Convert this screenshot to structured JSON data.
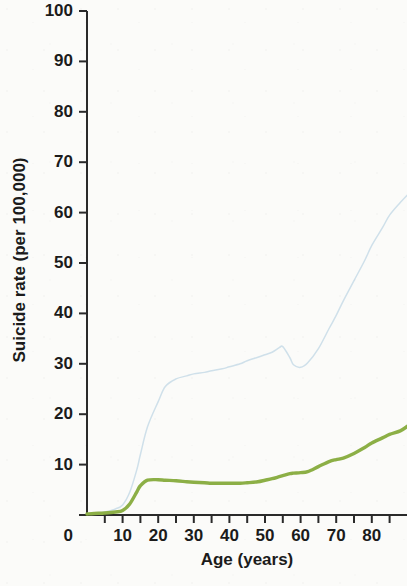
{
  "chart_data": {
    "type": "line",
    "title": "",
    "xlabel": "Age (years)",
    "ylabel": "Suicide rate (per 100,000)",
    "xlim": [
      0,
      90
    ],
    "ylim": [
      0,
      100
    ],
    "grid": false,
    "legend": "none",
    "x_tick_labels": [
      "10",
      "20",
      "30",
      "40",
      "50",
      "60",
      "70",
      "80"
    ],
    "x_tick_values": [
      10,
      20,
      30,
      40,
      50,
      60,
      70,
      80
    ],
    "x_minor_tick_values": [
      5,
      15,
      25,
      35,
      45,
      55,
      65,
      75,
      85
    ],
    "y_tick_labels": [
      "0",
      "10",
      "20",
      "30",
      "40",
      "50",
      "60",
      "70",
      "80",
      "90",
      "100"
    ],
    "y_tick_values": [
      0,
      10,
      20,
      30,
      40,
      50,
      60,
      70,
      80,
      90,
      100
    ],
    "x": [
      0,
      2,
      5,
      8,
      10,
      12,
      14,
      15,
      17,
      20,
      22,
      25,
      28,
      30,
      33,
      35,
      38,
      40,
      43,
      45,
      48,
      50,
      52,
      54,
      55,
      57,
      58,
      60,
      62,
      65,
      68,
      70,
      72,
      75,
      78,
      80,
      83,
      85,
      88,
      90
    ],
    "series": [
      {
        "name": "higher-rate-line",
        "color": "#cfe0ea",
        "style": "solid-thin",
        "values": [
          0.3,
          0.4,
          0.6,
          1.2,
          2.0,
          4.5,
          9.0,
          12.0,
          17.5,
          22.5,
          25.5,
          27.0,
          27.6,
          28.0,
          28.3,
          28.6,
          29.0,
          29.4,
          30.0,
          30.6,
          31.3,
          31.8,
          32.3,
          33.2,
          33.4,
          31.2,
          29.8,
          29.3,
          30.2,
          33.0,
          37.0,
          39.6,
          42.5,
          46.5,
          50.5,
          53.5,
          57.0,
          59.5,
          62.0,
          63.5
        ]
      },
      {
        "name": "lower-rate-line",
        "color": "#8caf46",
        "style": "solid-thick",
        "values": [
          0.2,
          0.3,
          0.4,
          0.6,
          0.9,
          2.2,
          4.6,
          5.8,
          6.9,
          7.0,
          6.9,
          6.8,
          6.6,
          6.5,
          6.4,
          6.3,
          6.3,
          6.3,
          6.3,
          6.4,
          6.6,
          6.9,
          7.2,
          7.6,
          7.8,
          8.2,
          8.3,
          8.4,
          8.6,
          9.6,
          10.6,
          11.0,
          11.3,
          12.2,
          13.4,
          14.3,
          15.3,
          16.0,
          16.7,
          17.6
        ]
      }
    ]
  }
}
